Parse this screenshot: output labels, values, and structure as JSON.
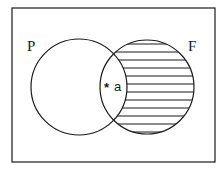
{
  "diagram": {
    "type": "venn",
    "sets": [
      {
        "label": "P",
        "shaded": false
      },
      {
        "label": "F",
        "shaded": true,
        "shading": "horizontal-lines",
        "shaded_region": "F minus P"
      }
    ],
    "intersection_marker": {
      "symbol": "*",
      "label": "a"
    }
  },
  "colors": {
    "stroke": "#1a1a1a",
    "background": "#ffffff"
  }
}
